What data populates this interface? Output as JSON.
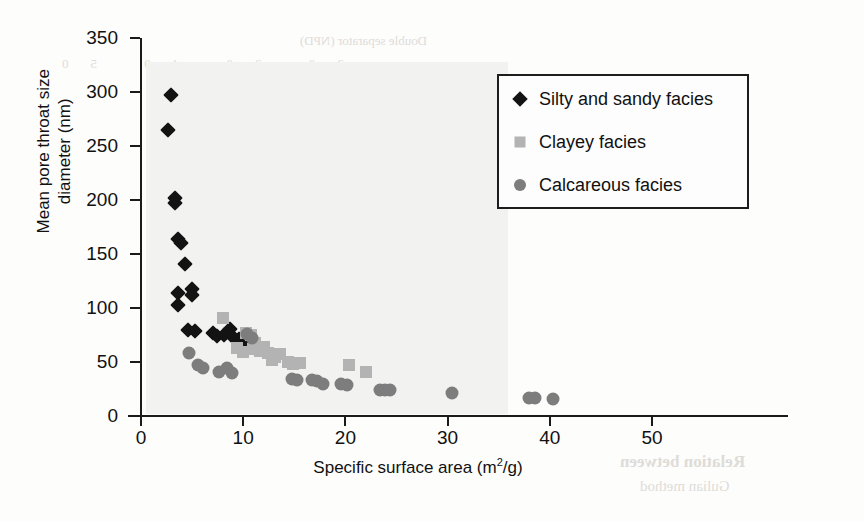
{
  "chart_data": {
    "type": "scatter",
    "title": "",
    "xlabel": "Specific surface area (m2/g)",
    "xlabel_base": "Specific surface area (m",
    "xlabel_sup": "2",
    "xlabel_tail": "/g)",
    "ylabel": "Mean pore throat size diameter (nm)",
    "ylabel_line1": "Mean pore throat size",
    "ylabel_line2": "diameter (nm)",
    "xlim": [
      0,
      50
    ],
    "ylim": [
      0,
      350
    ],
    "xticks": [
      0,
      10,
      20,
      30,
      40,
      50
    ],
    "yticks": [
      0,
      50,
      100,
      150,
      200,
      250,
      300,
      350
    ],
    "grid": false,
    "legend_position": "upper-right",
    "series": [
      {
        "name": "Silty and sandy facies",
        "marker": "diamond",
        "color": "#131313",
        "points": [
          [
            2.9,
            297
          ],
          [
            2.6,
            265
          ],
          [
            3.3,
            202
          ],
          [
            3.3,
            197
          ],
          [
            3.6,
            164
          ],
          [
            3.9,
            160
          ],
          [
            4.3,
            141
          ],
          [
            3.6,
            114
          ],
          [
            3.6,
            103
          ],
          [
            5.0,
            118
          ],
          [
            5.0,
            112
          ],
          [
            4.6,
            80
          ],
          [
            5.3,
            79
          ],
          [
            7.0,
            77
          ],
          [
            7.4,
            74
          ],
          [
            8.1,
            75
          ],
          [
            8.7,
            81
          ],
          [
            9.1,
            72
          ],
          [
            9.6,
            71
          ],
          [
            10.2,
            70
          ],
          [
            10.6,
            67
          ]
        ]
      },
      {
        "name": "Clayey facies",
        "marker": "square",
        "color": "#b3b3b3",
        "points": [
          [
            8.0,
            91
          ],
          [
            10.3,
            77
          ],
          [
            10.8,
            75
          ],
          [
            11.2,
            68
          ],
          [
            11.0,
            62
          ],
          [
            11.6,
            60
          ],
          [
            12.0,
            64
          ],
          [
            12.4,
            58
          ],
          [
            13.1,
            55
          ],
          [
            13.6,
            57
          ],
          [
            14.4,
            50
          ],
          [
            14.9,
            48
          ],
          [
            15.6,
            49
          ],
          [
            20.4,
            47
          ],
          [
            22.0,
            41
          ],
          [
            10.0,
            59
          ],
          [
            9.4,
            63
          ],
          [
            12.8,
            52
          ]
        ]
      },
      {
        "name": "Calcareous facies",
        "marker": "circle",
        "color": "#7d7d7d",
        "points": [
          [
            4.7,
            58
          ],
          [
            5.6,
            47
          ],
          [
            6.1,
            44
          ],
          [
            7.6,
            41
          ],
          [
            8.4,
            44
          ],
          [
            8.9,
            40
          ],
          [
            10.4,
            76
          ],
          [
            10.9,
            72
          ],
          [
            14.8,
            34
          ],
          [
            15.3,
            33
          ],
          [
            16.7,
            33
          ],
          [
            17.2,
            32
          ],
          [
            17.8,
            30
          ],
          [
            19.6,
            30
          ],
          [
            20.2,
            29
          ],
          [
            23.4,
            24
          ],
          [
            23.9,
            24
          ],
          [
            24.4,
            24
          ],
          [
            30.4,
            21
          ],
          [
            38.0,
            17
          ],
          [
            38.6,
            17
          ],
          [
            40.3,
            16
          ]
        ]
      }
    ]
  },
  "legend": {
    "entries": [
      {
        "label": "Silty and sandy facies",
        "marker": "diamond"
      },
      {
        "label": "Clayey facies",
        "marker": "square"
      },
      {
        "label": "Calcareous facies",
        "marker": "circle"
      }
    ]
  },
  "colors": {
    "diamond": "#131313",
    "square": "#b3b3b3",
    "circle": "#7d7d7d",
    "axis": "#1a1a1a",
    "text": "#111111",
    "background": "#ffffff"
  }
}
